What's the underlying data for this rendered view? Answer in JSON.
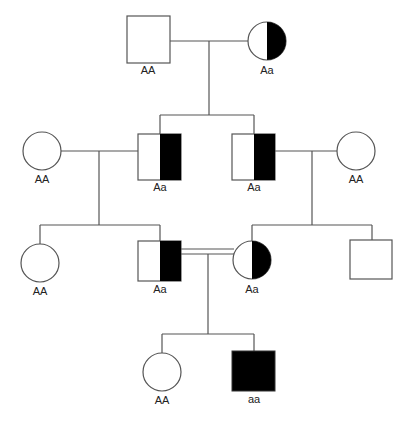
{
  "diagram": {
    "type": "pedigree",
    "colors": {
      "line": "#555555",
      "affected": "#000000",
      "unaffected": "#ffffff"
    },
    "generations": {
      "I": [
        {
          "id": "I-1",
          "sex": "male",
          "status": "unaffected",
          "genotype": "AA"
        },
        {
          "id": "I-2",
          "sex": "female",
          "status": "carrier",
          "genotype": "Aa"
        }
      ],
      "II": [
        {
          "id": "II-1",
          "sex": "female",
          "status": "unaffected",
          "genotype": "AA"
        },
        {
          "id": "II-2",
          "sex": "male",
          "status": "carrier",
          "genotype": "Aa"
        },
        {
          "id": "II-3",
          "sex": "male",
          "status": "carrier",
          "genotype": "Aa"
        },
        {
          "id": "II-4",
          "sex": "female",
          "status": "unaffected",
          "genotype": "AA"
        }
      ],
      "III": [
        {
          "id": "III-1",
          "sex": "female",
          "status": "unaffected",
          "genotype": "AA"
        },
        {
          "id": "III-2",
          "sex": "male",
          "status": "carrier",
          "genotype": "Aa"
        },
        {
          "id": "III-3",
          "sex": "female",
          "status": "carrier",
          "genotype": "Aa"
        },
        {
          "id": "III-4",
          "sex": "male",
          "status": "unaffected",
          "genotype": ""
        }
      ],
      "IV": [
        {
          "id": "IV-1",
          "sex": "female",
          "status": "unaffected",
          "genotype": "AA"
        },
        {
          "id": "IV-2",
          "sex": "male",
          "status": "affected",
          "genotype": "aa"
        }
      ]
    },
    "matings": [
      {
        "partners": [
          "I-1",
          "I-2"
        ],
        "consanguineous": false
      },
      {
        "partners": [
          "II-1",
          "II-2"
        ],
        "consanguineous": false
      },
      {
        "partners": [
          "II-3",
          "II-4"
        ],
        "consanguineous": false
      },
      {
        "partners": [
          "III-2",
          "III-3"
        ],
        "consanguineous": true
      }
    ]
  }
}
